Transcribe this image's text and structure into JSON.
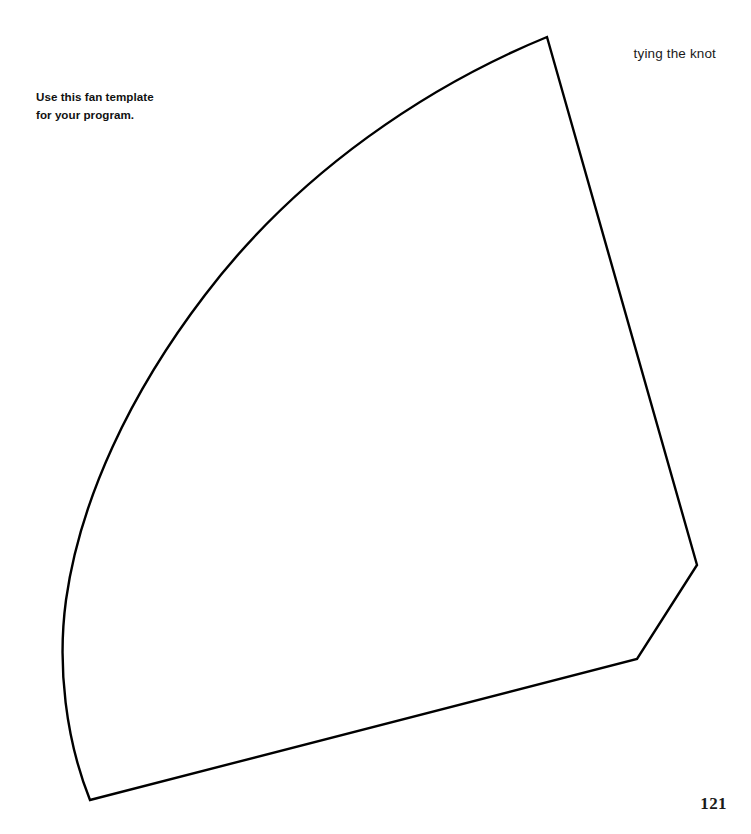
{
  "page": {
    "width": 751,
    "height": 834,
    "background_color": "#ffffff"
  },
  "running_head": {
    "text": "tying the knot"
  },
  "caption": {
    "line1": "Use this fan template",
    "line2": "for your program."
  },
  "folio": {
    "page_number": "121"
  },
  "template_shape": {
    "name": "fan-template-outline",
    "stroke_color": "#000000",
    "fill_color": "none",
    "stroke_width": 2.4,
    "description": "Quarter-fan / wedge cutting template outline",
    "vertices": {
      "apex_top": [
        547,
        37
      ],
      "right_vertex": [
        697,
        565
      ],
      "notch_vertex": [
        637,
        659
      ],
      "pivot_bottom_left": [
        90,
        800
      ],
      "arc_leftmost": [
        64,
        620
      ]
    },
    "arc": {
      "type": "circular",
      "center": [
        90,
        800
      ],
      "radius": 765,
      "start_point": [
        547,
        37
      ],
      "end_point": [
        90,
        800
      ]
    },
    "path": "M 547 37 C 430 85 300 170 205 295 C 130 393 80 500 66 600 C 57 667 66 740 90 800 L 637 659 L 697 565 L 547 37 Z"
  }
}
